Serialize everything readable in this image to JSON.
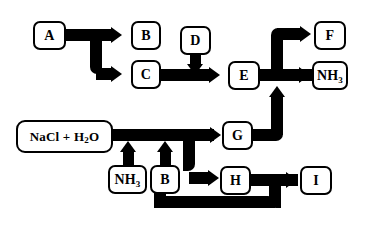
{
  "diagram": {
    "background_color": "#ffffff",
    "line_color": "#000000",
    "nodes": [
      {
        "id": "A",
        "label": "A",
        "x": 33,
        "y": 21,
        "w": 33,
        "h": 29
      },
      {
        "id": "B_top",
        "label": "B",
        "x": 131,
        "y": 21,
        "w": 30,
        "h": 29
      },
      {
        "id": "D",
        "label": "D",
        "x": 180,
        "y": 26,
        "w": 31,
        "h": 29
      },
      {
        "id": "F",
        "label": "F",
        "x": 314,
        "y": 21,
        "w": 32,
        "h": 29
      },
      {
        "id": "C",
        "label": "C",
        "x": 131,
        "y": 60,
        "w": 30,
        "h": 29
      },
      {
        "id": "E",
        "label": "E",
        "x": 228,
        "y": 61,
        "w": 32,
        "h": 29
      },
      {
        "id": "NH3_top",
        "label": "NH3",
        "x": 312,
        "y": 61,
        "w": 36,
        "h": 29
      },
      {
        "id": "NaClH2O",
        "label": "NaCl + H2O",
        "x": 16,
        "y": 120,
        "w": 97,
        "h": 33
      },
      {
        "id": "G",
        "label": "G",
        "x": 222,
        "y": 121,
        "w": 31,
        "h": 29
      },
      {
        "id": "NH3_bot",
        "label": "NH3",
        "x": 108,
        "y": 165,
        "w": 39,
        "h": 29
      },
      {
        "id": "B_bot",
        "label": "B",
        "x": 150,
        "y": 165,
        "w": 30,
        "h": 29
      },
      {
        "id": "H",
        "label": "H",
        "x": 220,
        "y": 166,
        "w": 31,
        "h": 29
      },
      {
        "id": "I",
        "label": "I",
        "x": 300,
        "y": 166,
        "w": 32,
        "h": 29
      }
    ],
    "edges": [
      {
        "from": "A",
        "to": "B_top",
        "kind": "branch-up"
      },
      {
        "from": "A",
        "to": "C",
        "kind": "branch-down"
      },
      {
        "from": "D",
        "to": "C-E-line",
        "kind": "down"
      },
      {
        "from": "C",
        "to": "E",
        "kind": "straight-right"
      },
      {
        "from": "E",
        "to": "F",
        "kind": "branch-up"
      },
      {
        "from": "E",
        "to": "NH3_top",
        "kind": "straight-right"
      },
      {
        "from": "G",
        "to": "E-NH3-line",
        "kind": "right-then-up"
      },
      {
        "from": "NaClH2O",
        "to": "G",
        "kind": "straight-right"
      },
      {
        "from": "NaClH2O",
        "to": "H",
        "kind": "branch-down"
      },
      {
        "from": "NH3_bot",
        "to": "NaCl-line",
        "kind": "up"
      },
      {
        "from": "B_bot",
        "to": "NaCl-line",
        "kind": "up"
      },
      {
        "from": "H",
        "to": "I",
        "kind": "straight-right"
      },
      {
        "from": "H-I-line",
        "to": "B_bot",
        "kind": "down-left-up-recycle"
      }
    ]
  }
}
